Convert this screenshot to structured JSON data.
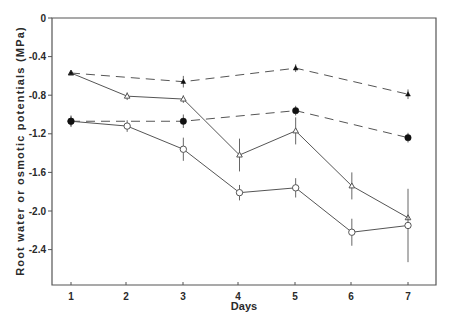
{
  "chart_data": {
    "type": "line",
    "title": "",
    "xlabel": "Days",
    "ylabel": "Root water or osmotic potentials (MPa)",
    "x": [
      1,
      2,
      3,
      4,
      5,
      6,
      7
    ],
    "xlim": [
      0.66,
      7.5
    ],
    "ylim": [
      -2.78,
      0
    ],
    "xticks": [
      "1",
      "2",
      "3",
      "4",
      "5",
      "6",
      "7"
    ],
    "yticks": [
      0,
      -0.4,
      -0.8,
      -1.2,
      -1.6,
      -2.0,
      -2.4
    ],
    "ytick_labels": [
      "0",
      "-0.4",
      "-0.8",
      "-1.2",
      "-1.6",
      "-2.0",
      "-2.4"
    ],
    "grid": false,
    "legend": null,
    "series": [
      {
        "name": "Series A (open triangle, solid)",
        "marker": "open-triangle",
        "line": "solid",
        "x": [
          1,
          2,
          3,
          4,
          5,
          6,
          7
        ],
        "values": [
          -0.57,
          -0.81,
          -0.84,
          -1.42,
          -1.17,
          -1.74,
          -2.07
        ],
        "errors": [
          0.02,
          0.04,
          0.04,
          0.17,
          0.14,
          0.14,
          0.0
        ]
      },
      {
        "name": "Series B (open circle, solid)",
        "marker": "open-circle",
        "line": "solid",
        "x": [
          1,
          2,
          3,
          4,
          5,
          6,
          7
        ],
        "values": [
          -1.07,
          -1.12,
          -1.36,
          -1.81,
          -1.76,
          -2.22,
          -2.15
        ],
        "errors": [
          0.05,
          0.06,
          0.12,
          0.08,
          0.1,
          0.14,
          0.38
        ]
      },
      {
        "name": "Series C (filled triangle, dashed)",
        "marker": "filled-triangle",
        "line": "dashed",
        "x": [
          1,
          3,
          5,
          7
        ],
        "values": [
          -0.57,
          -0.66,
          -0.52,
          -0.79
        ],
        "errors": [
          0.02,
          0.06,
          0.04,
          0.05
        ]
      },
      {
        "name": "Series D (filled circle, dashed)",
        "marker": "filled-circle",
        "line": "dashed",
        "x": [
          1,
          3,
          5,
          7
        ],
        "values": [
          -1.07,
          -1.07,
          -0.96,
          -1.24
        ],
        "errors": [
          0.06,
          0.07,
          0.05,
          0.05
        ]
      }
    ]
  },
  "layout_px": {
    "plot_left": 52,
    "plot_right": 436,
    "plot_top": 18,
    "plot_bottom": 285,
    "x_px": [
      71,
      126,
      183,
      238,
      295,
      351,
      408
    ],
    "px_per_unit": 96.5
  },
  "colors": {
    "axis": "#555555",
    "line": "#555555",
    "text": "#2a2a2a",
    "marker_fill": "#ffffff",
    "marker_solid": "#111111"
  }
}
